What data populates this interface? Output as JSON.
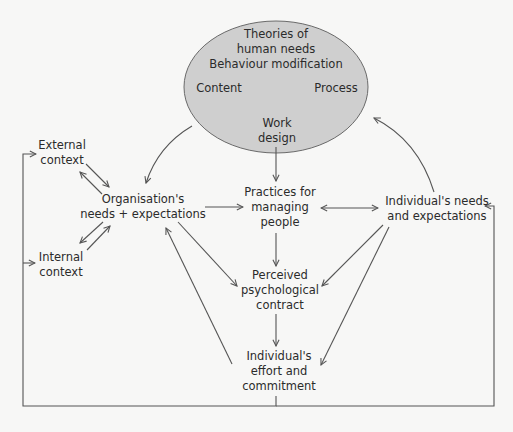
{
  "diagram": {
    "colors": {
      "background": "#f7f7f6",
      "ellipse_fill": "#cfcfcf",
      "ellipse_stroke": "#6a6a6a",
      "line": "#555555",
      "text": "#2b2b2b"
    },
    "ellipse": {
      "title_line1": "Theories of",
      "title_line2": "human needs",
      "title_line3": "Behaviour modification",
      "left_label": "Content",
      "right_label": "Process",
      "bottom_line1": "Work",
      "bottom_line2": "design"
    },
    "nodes": {
      "external_context": {
        "line1": "External",
        "line2": "context"
      },
      "internal_context": {
        "line1": "Internal",
        "line2": "context"
      },
      "organisation_needs": {
        "line1": "Organisation's",
        "line2": "needs + expectations"
      },
      "practices": {
        "line1": "Practices for",
        "line2": "managing",
        "line3": "people"
      },
      "individual_needs": {
        "line1": "Individual's needs",
        "line2": "and expectations"
      },
      "psych_contract": {
        "line1": "Perceived",
        "line2": "psychological",
        "line3": "contract"
      },
      "effort_commitment": {
        "line1": "Individual's",
        "line2": "effort and",
        "line3": "commitment"
      }
    },
    "edges": [
      {
        "from": "ellipse",
        "to": "organisation_needs",
        "type": "curved-arrow"
      },
      {
        "from": "ellipse",
        "to": "practices",
        "type": "arrow"
      },
      {
        "from": "individual_needs",
        "to": "ellipse",
        "type": "curved-arrow"
      },
      {
        "from": "external_context",
        "to": "organisation_needs",
        "type": "arrow"
      },
      {
        "from": "organisation_needs",
        "to": "external_context",
        "type": "arrow"
      },
      {
        "from": "organisation_needs",
        "to": "internal_context",
        "type": "arrow"
      },
      {
        "from": "internal_context",
        "to": "organisation_needs",
        "type": "arrow"
      },
      {
        "from": "organisation_needs",
        "to": "practices",
        "type": "arrow"
      },
      {
        "from": "practices",
        "to": "individual_needs",
        "type": "double-arrow"
      },
      {
        "from": "practices",
        "to": "psych_contract",
        "type": "arrow"
      },
      {
        "from": "organisation_needs",
        "to": "psych_contract",
        "type": "arrow"
      },
      {
        "from": "individual_needs",
        "to": "psych_contract",
        "type": "arrow"
      },
      {
        "from": "psych_contract",
        "to": "effort_commitment",
        "type": "arrow"
      },
      {
        "from": "effort_commitment",
        "to": "organisation_needs",
        "type": "arrow"
      },
      {
        "from": "individual_needs",
        "to": "effort_commitment",
        "type": "arrow"
      },
      {
        "from": "effort_commitment",
        "to": "external_context",
        "type": "feedback-loop"
      },
      {
        "from": "effort_commitment",
        "to": "internal_context",
        "type": "feedback-loop"
      },
      {
        "from": "effort_commitment",
        "to": "individual_needs",
        "type": "feedback-loop"
      }
    ]
  }
}
